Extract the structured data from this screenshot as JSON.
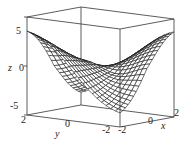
{
  "chart_data": {
    "type": "surface3d",
    "title": "",
    "xlabel": "x",
    "ylabel": "y",
    "zlabel": "z",
    "x_ticks": [
      "-2",
      "0",
      "2"
    ],
    "y_ticks": [
      "2",
      "0",
      "-2"
    ],
    "z_ticks": [
      "5",
      "0",
      "-5"
    ],
    "xlim": [
      -2,
      2
    ],
    "ylim": [
      -2,
      2
    ],
    "zlim": [
      -5,
      5
    ],
    "grid": false,
    "box": true,
    "mesh_resolution": 20,
    "surface_style": "wireframe mesh, black lines on white"
  },
  "colors": {
    "mesh": "#1a1a1a",
    "box": "#333333",
    "background": "#ffffff"
  }
}
